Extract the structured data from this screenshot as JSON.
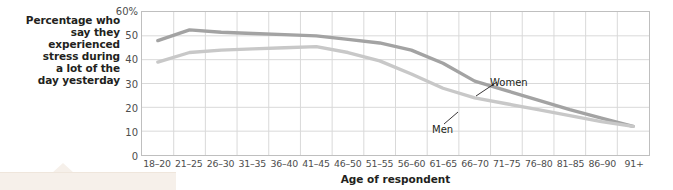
{
  "chart_data": {
    "type": "line",
    "title": "",
    "subtitle": "",
    "ylabel": "Percentage who\nsay they\nexperienced\nstress during\na lot of the\nday yesterday",
    "xlabel": "Age of respondent",
    "categories": [
      "18–20",
      "21–25",
      "26–30",
      "31–35",
      "36–40",
      "41–45",
      "46–50",
      "51–55",
      "56–60",
      "61–65",
      "66–70",
      "71–75",
      "76–80",
      "81–85",
      "86–90",
      "91+"
    ],
    "yticks": [
      0,
      10,
      20,
      30,
      40,
      50,
      60
    ],
    "ytick_labels": [
      "0",
      "10",
      "20",
      "30",
      "40",
      "50",
      "60%"
    ],
    "ylim": [
      0,
      60
    ],
    "grid": true,
    "legend_position": "inline-annotation",
    "series": [
      {
        "name": "Women",
        "color": "#a3a3a3",
        "values": [
          48,
          52.5,
          51.5,
          51,
          50.5,
          50,
          48.5,
          47,
          44,
          38.5,
          31,
          27,
          23,
          19,
          15.5,
          12
        ]
      },
      {
        "name": "Men",
        "color": "#c8c8c8",
        "values": [
          39,
          43,
          44,
          44.5,
          45,
          45.5,
          43,
          39.5,
          34,
          28,
          24,
          21.5,
          19,
          16.5,
          14,
          12
        ]
      }
    ],
    "annotations": [
      {
        "name": "Women",
        "label": "Women"
      },
      {
        "name": "Men",
        "label": "Men"
      }
    ]
  },
  "colors": {
    "women_line": "#a3a3a3",
    "men_line": "#c8c8c8",
    "grid": "#d9d9d9",
    "axis_border": "#bfbfbf",
    "text": "#231f20",
    "tick_text": "#4d4d4d",
    "callout": "#f6f0ea"
  }
}
